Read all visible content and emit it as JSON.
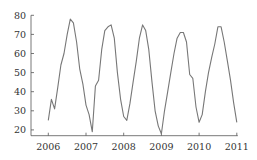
{
  "chart_data": {
    "type": "line",
    "title": "",
    "xlabel": "",
    "ylabel": "",
    "xlim": [
      2006,
      2011
    ],
    "ylim": [
      15,
      80
    ],
    "grid": false,
    "legend": null,
    "x_ticks": [
      "2006",
      "2007",
      "2008",
      "2009",
      "2010",
      "2011"
    ],
    "y_ticks": [
      "20",
      "30",
      "40",
      "50",
      "60",
      "70",
      "80"
    ],
    "series": [
      {
        "name": "series",
        "color": "#777777",
        "x": [
          2006.0,
          2006.083,
          2006.167,
          2006.25,
          2006.333,
          2006.417,
          2006.5,
          2006.583,
          2006.667,
          2006.75,
          2006.833,
          2006.917,
          2007.0,
          2007.083,
          2007.167,
          2007.25,
          2007.333,
          2007.417,
          2007.5,
          2007.583,
          2007.667,
          2007.75,
          2007.833,
          2007.917,
          2008.0,
          2008.083,
          2008.167,
          2008.25,
          2008.333,
          2008.417,
          2008.5,
          2008.583,
          2008.667,
          2008.75,
          2008.833,
          2008.917,
          2009.0,
          2009.083,
          2009.167,
          2009.25,
          2009.333,
          2009.417,
          2009.5,
          2009.583,
          2009.667,
          2009.75,
          2009.833,
          2009.917,
          2010.0,
          2010.083,
          2010.167,
          2010.25,
          2010.333,
          2010.417,
          2010.5,
          2010.583,
          2010.667,
          2010.75,
          2010.833,
          2010.917,
          2011.0
        ],
        "values": [
          25,
          36,
          31,
          42,
          54,
          60,
          70,
          78,
          76,
          66,
          52,
          44,
          33,
          28,
          19,
          43,
          46,
          62,
          72,
          74,
          75,
          68,
          50,
          36,
          27,
          25,
          34,
          45,
          56,
          68,
          75,
          72,
          62,
          45,
          30,
          22,
          18,
          30,
          40,
          50,
          60,
          68,
          71,
          71,
          66,
          49,
          47,
          32,
          24,
          28,
          40,
          50,
          58,
          65,
          74,
          74,
          66,
          56,
          46,
          34,
          24
        ]
      }
    ]
  }
}
